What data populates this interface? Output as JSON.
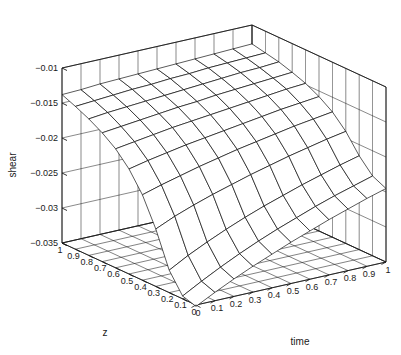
{
  "figure": {
    "width": 401,
    "height": 355,
    "background": "#ffffff",
    "line_color": "#1a1a1a",
    "mesh_color": "#000000",
    "tick_color": "#1a1a1a"
  },
  "axes": {
    "z_axis": {
      "name": "z",
      "title": "z",
      "ticks": [
        "1",
        "0.9",
        "0.8",
        "0.7",
        "0.6",
        "0.5",
        "0.4",
        "0.3",
        "0.2",
        "0.1",
        "0"
      ],
      "tick_values": [
        1,
        0.9,
        0.8,
        0.7,
        0.6,
        0.5,
        0.4,
        0.3,
        0.2,
        0.1,
        0
      ],
      "range": [
        0,
        1
      ],
      "direction": "descending-left-to-front"
    },
    "time_axis": {
      "name": "time",
      "title": "time",
      "ticks": [
        "0",
        "0.1",
        "0.2",
        "0.3",
        "0.4",
        "0.5",
        "0.6",
        "0.7",
        "0.8",
        "0.9",
        "1"
      ],
      "tick_values": [
        0,
        0.1,
        0.2,
        0.3,
        0.4,
        0.5,
        0.6,
        0.7,
        0.8,
        0.9,
        1
      ],
      "range": [
        0,
        1
      ],
      "direction": "ascending-front-to-right"
    },
    "shear_axis": {
      "name": "shear",
      "title": "shear",
      "ticks": [
        "−0.01",
        "−0.015",
        "−0.02",
        "−0.025",
        "−0.03",
        "−0.035"
      ],
      "tick_values": [
        -0.01,
        -0.015,
        -0.02,
        -0.025,
        -0.03,
        -0.035
      ],
      "range": [
        -0.035,
        -0.01
      ],
      "rotation": -90
    }
  },
  "chart_data": {
    "type": "surface",
    "title": "",
    "xlabel": "z",
    "ylabel": "time",
    "zlabel": "shear",
    "grid": true,
    "legend": false,
    "legend_position": "none",
    "projection": "3d-mesh",
    "xlim": [
      0,
      1
    ],
    "ylim": [
      0,
      1
    ],
    "zlim": [
      -0.035,
      -0.01
    ],
    "x": [
      0,
      0.1,
      0.2,
      0.3,
      0.4,
      0.5,
      0.6,
      0.7,
      0.8,
      0.9,
      1
    ],
    "y": [
      0,
      0.1,
      0.2,
      0.3,
      0.4,
      0.5,
      0.6,
      0.7,
      0.8,
      0.9,
      1
    ],
    "x_name": "z",
    "y_name": "time",
    "z_name": "shear",
    "values": [
      [
        -0.0352,
        -0.0338,
        -0.0325,
        -0.0313,
        -0.0302,
        -0.0291,
        -0.0281,
        -0.0271,
        -0.0262,
        -0.0253,
        -0.0245
      ],
      [
        -0.0346,
        -0.0331,
        -0.0317,
        -0.0304,
        -0.0292,
        -0.0281,
        -0.0271,
        -0.0261,
        -0.0252,
        -0.0244,
        -0.0236
      ],
      [
        -0.0318,
        -0.0303,
        -0.029,
        -0.0278,
        -0.0267,
        -0.0257,
        -0.0248,
        -0.0239,
        -0.0231,
        -0.0223,
        -0.0216
      ],
      [
        -0.0268,
        -0.0256,
        -0.0246,
        -0.0237,
        -0.0229,
        -0.0221,
        -0.0214,
        -0.0207,
        -0.0201,
        -0.0195,
        -0.019
      ],
      [
        -0.0228,
        -0.022,
        -0.0213,
        -0.0206,
        -0.02,
        -0.0194,
        -0.0189,
        -0.0184,
        -0.0179,
        -0.0175,
        -0.0171
      ],
      [
        -0.02,
        -0.0194,
        -0.0189,
        -0.0184,
        -0.018,
        -0.0176,
        -0.0172,
        -0.0168,
        -0.0164,
        -0.0161,
        -0.0158
      ],
      [
        -0.018,
        -0.0176,
        -0.0172,
        -0.0168,
        -0.0165,
        -0.0162,
        -0.0159,
        -0.0156,
        -0.0153,
        -0.015,
        -0.0148
      ],
      [
        -0.0166,
        -0.0163,
        -0.016,
        -0.0157,
        -0.0154,
        -0.0152,
        -0.0149,
        -0.0147,
        -0.0145,
        -0.0143,
        -0.0141
      ],
      [
        -0.0155,
        -0.0152,
        -0.015,
        -0.0148,
        -0.0146,
        -0.0144,
        -0.0142,
        -0.014,
        -0.0138,
        -0.0137,
        -0.0135
      ],
      [
        -0.0146,
        -0.0144,
        -0.0142,
        -0.014,
        -0.0139,
        -0.0137,
        -0.0136,
        -0.0134,
        -0.0133,
        -0.0132,
        -0.0131
      ],
      [
        -0.0138,
        -0.0137,
        -0.0135,
        -0.0134,
        -0.0133,
        -0.0132,
        -0.0131,
        -0.013,
        -0.0129,
        -0.0128,
        -0.0127
      ]
    ]
  },
  "geometry": {
    "origin_front": [
      196,
      305
    ],
    "corner_left": [
      62,
      243
    ],
    "corner_right": [
      386,
      262
    ],
    "corner_back": [
      252,
      207
    ],
    "z_height_px": 175
  }
}
